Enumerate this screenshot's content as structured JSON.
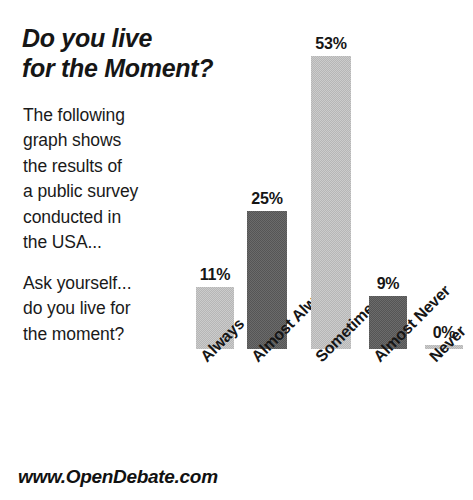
{
  "headline": {
    "line1": "Do you live",
    "line2": "for the Moment?"
  },
  "paragraph_1": {
    "l1": "The following",
    "l2": "graph shows",
    "l3": "the results of",
    "l4": "a public survey",
    "l5": "conducted in",
    "l6": "the USA..."
  },
  "paragraph_2": {
    "l1": "Ask yourself...",
    "l2": "do you live for",
    "l3": "the moment?"
  },
  "footer": {
    "url": "www.OpenDebate.com"
  },
  "colors": {
    "light_bar": "#b6b6b6",
    "dark_bar": "#555555",
    "text": "#161616",
    "background": "#ffffff"
  },
  "chart_data": {
    "type": "bar",
    "title": "Do you live for the Moment?",
    "xlabel": "",
    "ylabel": "",
    "ylim": [
      0,
      53
    ],
    "grid": false,
    "legend": "none",
    "categories": [
      "Always",
      "Almost Always",
      "Sometimes",
      "Almost Never",
      "Never"
    ],
    "values": [
      11,
      25,
      53,
      9,
      0
    ],
    "value_labels": [
      "11%",
      "25%",
      "53%",
      "9%",
      "0%"
    ],
    "bar_shades": [
      "light",
      "dark",
      "light",
      "dark",
      "light"
    ],
    "bars": [
      {
        "category": "Always",
        "value": 11,
        "label": "11%",
        "shade": "light",
        "x": 196,
        "width": 38,
        "top": 287,
        "bottom": 349
      },
      {
        "category": "Almost Always",
        "value": 25,
        "label": "25%",
        "shade": "dark",
        "x": 247,
        "width": 40,
        "top": 211,
        "bottom": 349
      },
      {
        "category": "Sometimes",
        "value": 53,
        "label": "53%",
        "shade": "light",
        "x": 311,
        "width": 40,
        "top": 56,
        "bottom": 349
      },
      {
        "category": "Almost Never",
        "value": 9,
        "label": "9%",
        "shade": "dark",
        "x": 369,
        "width": 38,
        "top": 296,
        "bottom": 349
      },
      {
        "category": "Never",
        "value": 0,
        "label": "0%",
        "shade": "light",
        "x": 425,
        "width": 38,
        "top": 345,
        "bottom": 349
      }
    ]
  }
}
